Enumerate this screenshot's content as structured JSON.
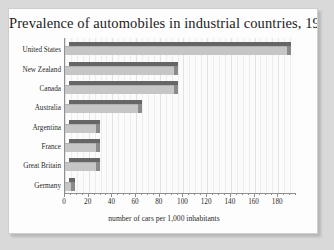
{
  "chart_data": {
    "type": "bar",
    "orientation": "horizontal",
    "title": "Prevalence of automobiles in industrial countries, 1927",
    "xlabel": "number of cars per 1,000 inhabitants",
    "ylabel": "",
    "categories": [
      "United States",
      "New Zealand",
      "Canada",
      "Australia",
      "Argentina",
      "France",
      "Great Britain",
      "Germany"
    ],
    "values": [
      187,
      92,
      92,
      62,
      26,
      26,
      26,
      5
    ],
    "xlim": [
      0,
      195
    ],
    "xticks": [
      0,
      20,
      40,
      60,
      80,
      100,
      120,
      140,
      160,
      180
    ],
    "xticklabels": [
      "0",
      "20",
      "40",
      "60",
      "80",
      "100",
      "120",
      "140",
      "160",
      "180"
    ],
    "minor_tick_step": 5,
    "grid": true,
    "grid_axis": "x",
    "legend": null,
    "series": [
      {
        "name": "cars per 1,000 inhabitants",
        "values": [
          187,
          92,
          92,
          62,
          26,
          26,
          26,
          5
        ]
      }
    ]
  },
  "style": {
    "bar_front_color": "#c6c6c6",
    "bar_top_color": "#666666",
    "bar_side_color": "#8a8a8a",
    "axis_color": "#8f8f8f",
    "page_background": "#d9d9d9",
    "card_background": "#fdfdfd",
    "text_color": "#2a2a2a",
    "title_color": "#1c1c1c"
  }
}
